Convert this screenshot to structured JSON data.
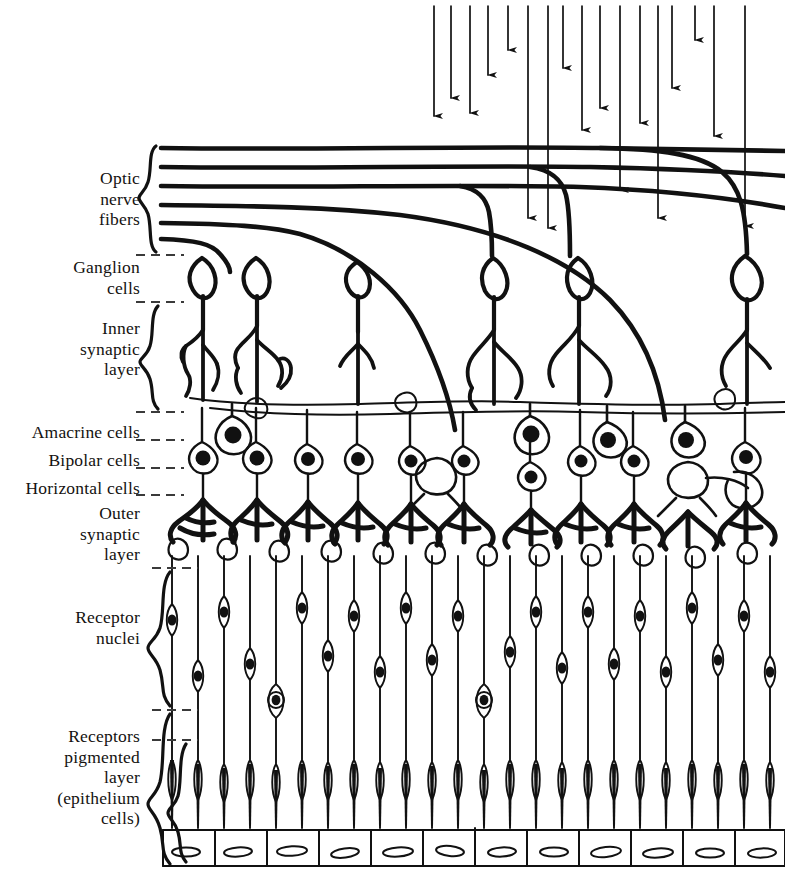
{
  "figure": {
    "kind": "anatomical-line-diagram",
    "background_color": "#ffffff",
    "ink_color": "#111111",
    "light_direction": "top-to-bottom",
    "light_arrow_count": 17
  },
  "labels": [
    {
      "id": "optic-nerve-fibers",
      "text": "Optic\nnerve\nfibers",
      "x": 140,
      "y": 168,
      "brace": true
    },
    {
      "id": "ganglion-cells",
      "text": "Ganglion\ncells",
      "x": 140,
      "y": 257,
      "brace": false
    },
    {
      "id": "inner-synaptic-layer",
      "text": "Inner\nsynaptic\nlayer",
      "x": 140,
      "y": 318,
      "brace": true
    },
    {
      "id": "amacrine-cells",
      "text": "Amacrine cells",
      "x": 140,
      "y": 422,
      "brace": false
    },
    {
      "id": "bipolar-cells",
      "text": "Bipolar cells",
      "x": 140,
      "y": 450,
      "brace": false
    },
    {
      "id": "horizontal-cells",
      "text": "Horizontal cells",
      "x": 140,
      "y": 478,
      "brace": false
    },
    {
      "id": "outer-synaptic-layer",
      "text": "Outer\nsynaptic\nlayer",
      "x": 140,
      "y": 502,
      "brace": false
    },
    {
      "id": "receptor-nuclei",
      "text": "Receptor\nnuclei",
      "x": 140,
      "y": 607,
      "brace": true
    },
    {
      "id": "receptors-pigmented-layer",
      "text": "Receptors\npigmented\nlayer\n(epithelium\ncells)",
      "x": 140,
      "y": 726,
      "brace": true
    }
  ],
  "layer_divider_lines": [
    {
      "id": "divider-above-ganglion",
      "y": 255,
      "x1": 136,
      "x2": 184
    },
    {
      "id": "divider-below-ganglion",
      "y": 302,
      "x1": 136,
      "x2": 184
    },
    {
      "id": "divider-below-inner-synaptic",
      "y": 412,
      "x1": 136,
      "x2": 184
    },
    {
      "id": "divider-amacrine",
      "y": 440,
      "x1": 136,
      "x2": 184
    },
    {
      "id": "divider-bipolar",
      "y": 468,
      "x1": 136,
      "x2": 184
    },
    {
      "id": "divider-horizontal",
      "y": 495,
      "x1": 136,
      "x2": 184
    },
    {
      "id": "divider-outer-synaptic",
      "y": 568,
      "x1": 150,
      "x2": 196
    },
    {
      "id": "divider-receptor-nuclei",
      "y": 710,
      "x1": 150,
      "x2": 196
    },
    {
      "id": "divider-pigmented",
      "y": 740,
      "x1": 150,
      "x2": 196
    }
  ],
  "braces": [
    {
      "id": "brace-optic-nerve-fibers",
      "x": 152,
      "y_top": 146,
      "y_bottom": 252
    },
    {
      "id": "brace-inner-synaptic-layer",
      "x": 152,
      "y_top": 306,
      "y_bottom": 409
    },
    {
      "id": "brace-receptor-nuclei",
      "x": 164,
      "y_top": 572,
      "y_bottom": 706
    },
    {
      "id": "brace-receptors-pigmented-layer",
      "x": 164,
      "y_top": 714,
      "y_bottom": 864
    },
    {
      "id": "brace-pigmented-inner",
      "x": 180,
      "y_top": 744,
      "y_bottom": 862
    }
  ],
  "nerve_fibers": {
    "count": 5,
    "x_start": 160,
    "y_values": [
      148,
      166,
      184,
      203,
      222,
      238
    ]
  },
  "ganglion_cells": {
    "count": 6,
    "x_positions": [
      202,
      256,
      357,
      495,
      580,
      745
    ],
    "y_center": 277
  },
  "amacrine_cells": {
    "count": 4,
    "x_positions": [
      232,
      530,
      607,
      685
    ],
    "y_center": 432
  },
  "bipolar_cells": {
    "count": 10,
    "x_positions": [
      202,
      256,
      307,
      357,
      410,
      463,
      530,
      580,
      633,
      745
    ],
    "y_center": 456
  },
  "horizontal_cells": {
    "count": 4,
    "x_positions": [
      437,
      500,
      672,
      712
    ],
    "y_center": 478
  },
  "receptor_columns": {
    "count": 24,
    "x_start": 170,
    "spacing": 26,
    "nuclei_rows_y": [
      612,
      648,
      684
    ]
  },
  "epithelium_cells": {
    "count": 12,
    "x_start": 163,
    "width": 52,
    "y_top": 828,
    "y_bottom": 866
  }
}
